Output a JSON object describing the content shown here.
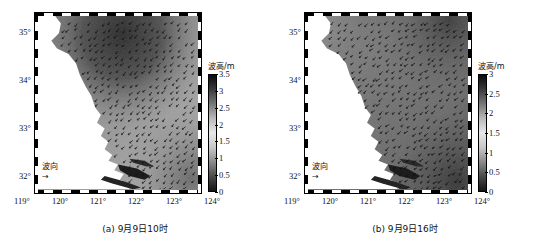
{
  "figure": {
    "background": "#ffffff",
    "panels": [
      {
        "id": "a",
        "caption": "(a) 9月9日10时",
        "colorbar": {
          "title": "波高/m",
          "ticks": [
            "3.5",
            "3",
            "2.5",
            "2",
            "1.5",
            "1",
            "0.5",
            "0"
          ],
          "min": 0,
          "max": 3.5,
          "colors": [
            "#0a0a0a",
            "#3b3b3b",
            "#777777",
            "#b9b9b9",
            "#e8e8e8",
            "#c8c8c8",
            "#8a8a8a",
            "#4a4a4a",
            "#141414"
          ]
        },
        "direction_key": {
          "label": "波向",
          "arrow": "→"
        },
        "x_axis": {
          "ticks": [
            "119°",
            "120°",
            "121°",
            "122°",
            "123°",
            "124°"
          ],
          "min": 119,
          "max": 124
        },
        "y_axis": {
          "ticks": [
            "35°",
            "34°",
            "33°",
            "32°"
          ],
          "min": 31.6,
          "max": 35.4
        }
      },
      {
        "id": "b",
        "caption": "(b) 9月9日16时",
        "colorbar": {
          "title": "波高/m",
          "ticks": [
            "3",
            "2.5",
            "2",
            "1.5",
            "1",
            "0.5",
            "0"
          ],
          "min": 0,
          "max": 3,
          "colors": [
            "#0a0a0a",
            "#3b3b3b",
            "#777777",
            "#b9b9b9",
            "#e8e8e8",
            "#c8c8c8",
            "#8a8a8a",
            "#4a4a4a",
            "#141414"
          ]
        },
        "direction_key": {
          "label": "波向",
          "arrow": "→"
        },
        "x_axis": {
          "ticks": [
            "119°",
            "120°",
            "121°",
            "122°",
            "123°",
            "124°"
          ],
          "min": 119,
          "max": 124
        },
        "y_axis": {
          "ticks": [
            "35°",
            "34°",
            "33°",
            "32°"
          ],
          "min": 31.6,
          "max": 35.4
        }
      }
    ]
  },
  "chart_data": {
    "type": "heatmap",
    "title": "",
    "xlabel": "",
    "ylabel": "",
    "xlim": [
      119,
      124
    ],
    "ylim": [
      31.6,
      35.4
    ],
    "grid": false,
    "legend_position": "right",
    "colorbar_label": "波高/m",
    "panels": [
      {
        "name": "(a) 9月9日10时",
        "zlim": [
          0,
          3.5
        ],
        "z_ticks": [
          0,
          0.5,
          1,
          1.5,
          2,
          2.5,
          3,
          3.5
        ],
        "field_description": "Significant wave height over the East China Sea off the Jiangsu/Shanghai coast; land (white) occupies the west/southwest. A dark maximum core of about 3.2-3.5 m sits near 121.5°E-122.5°E, 34.5°N-35.4°N, grading to roughly 1.5-2.5 m offshore to the east and below 1 m along the nearshore shallows.",
        "sample_points": [
          {
            "lon": 121.8,
            "lat": 35.1,
            "wave_height_m": 3.4
          },
          {
            "lon": 122.4,
            "lat": 34.8,
            "wave_height_m": 3.1
          },
          {
            "lon": 120.6,
            "lat": 34.9,
            "wave_height_m": 2.6
          },
          {
            "lon": 123.2,
            "lat": 34.4,
            "wave_height_m": 2.2
          },
          {
            "lon": 122.6,
            "lat": 33.6,
            "wave_height_m": 2.0
          },
          {
            "lon": 123.6,
            "lat": 33.1,
            "wave_height_m": 1.9
          },
          {
            "lon": 121.8,
            "lat": 32.9,
            "wave_height_m": 1.4
          },
          {
            "lon": 122.8,
            "lat": 32.2,
            "wave_height_m": 1.6
          },
          {
            "lon": 121.4,
            "lat": 32.1,
            "wave_height_m": 0.8
          },
          {
            "lon": 120.4,
            "lat": 33.8,
            "wave_height_m": 1.0
          }
        ],
        "wave_direction_deg_from_north": 135,
        "wave_direction_note": "Arrows point predominantly toward the southwest/west-southwest, onshore toward the coast."
      },
      {
        "name": "(b) 9月9日16时",
        "zlim": [
          0,
          3
        ],
        "z_ticks": [
          0,
          0.5,
          1,
          1.5,
          2,
          2.5,
          3
        ],
        "field_description": "Six hours later the field is darker and more uniform: wave heights of roughly 2.5-3 m cover most of the open-sea area east of 121.5°E, with the largest values in the far northeast and southeast corners, while the nearshore band west of 121°E stays under about 1.5 m.",
        "sample_points": [
          {
            "lon": 122.2,
            "lat": 35.1,
            "wave_height_m": 2.9
          },
          {
            "lon": 123.4,
            "lat": 34.9,
            "wave_height_m": 2.8
          },
          {
            "lon": 120.8,
            "lat": 34.9,
            "wave_height_m": 2.3
          },
          {
            "lon": 123.0,
            "lat": 34.2,
            "wave_height_m": 2.7
          },
          {
            "lon": 122.4,
            "lat": 33.5,
            "wave_height_m": 2.4
          },
          {
            "lon": 123.6,
            "lat": 32.8,
            "wave_height_m": 2.9
          },
          {
            "lon": 121.9,
            "lat": 32.8,
            "wave_height_m": 1.8
          },
          {
            "lon": 122.9,
            "lat": 32.1,
            "wave_height_m": 2.6
          },
          {
            "lon": 121.3,
            "lat": 32.0,
            "wave_height_m": 1.1
          },
          {
            "lon": 120.4,
            "lat": 33.8,
            "wave_height_m": 1.2
          }
        ],
        "wave_direction_deg_from_north": 140,
        "wave_direction_note": "Arrows point toward the west-southwest, slightly more southerly than in panel (a)."
      }
    ]
  }
}
